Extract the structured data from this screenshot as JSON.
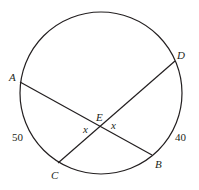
{
  "diagram": {
    "type": "circle-intersecting-chords",
    "stroke_color": "#231f20",
    "background": "#ffffff",
    "circle": {
      "cx": 101,
      "cy": 93,
      "r": 81
    },
    "points": {
      "A": {
        "label": "A",
        "x": 20,
        "y": 82
      },
      "B": {
        "label": "B",
        "x": 152,
        "y": 155
      },
      "C": {
        "label": "C",
        "x": 58,
        "y": 163
      },
      "D": {
        "label": "D",
        "x": 175,
        "y": 61
      },
      "E": {
        "label": "E",
        "x": 99,
        "y": 126
      }
    },
    "chords": [
      {
        "from": "A",
        "to": "B"
      },
      {
        "from": "C",
        "to": "D"
      }
    ],
    "angle_labels": {
      "left": "x",
      "right": "x"
    },
    "arc_labels": {
      "arc_AC": "50",
      "arc_DB": "40"
    }
  }
}
